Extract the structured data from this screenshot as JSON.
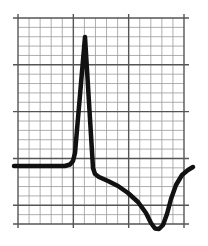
{
  "figure": {
    "colors": {
      "background": "#ffffff",
      "minor_grid": "#9a9a9a",
      "major_grid": "#555555",
      "trace": "#111111"
    },
    "grid": {
      "left": 18,
      "top": 18,
      "right": 184,
      "bottom": 224,
      "columns": 15,
      "rows": 22,
      "major_every_col": 5,
      "major_every_row": 5
    },
    "trace": {
      "label": "waveform",
      "stroke_width": 4.5,
      "points": [
        [
          14,
          166
        ],
        [
          65,
          166
        ],
        [
          70,
          164.5
        ],
        [
          73,
          161
        ],
        [
          75,
          153
        ],
        [
          85,
          37
        ],
        [
          93,
          168
        ],
        [
          95,
          174
        ],
        [
          99,
          177
        ],
        [
          108,
          181
        ],
        [
          118,
          186
        ],
        [
          128,
          193
        ],
        [
          138,
          202
        ],
        [
          146,
          213
        ],
        [
          151,
          223
        ],
        [
          155,
          228.5
        ],
        [
          159,
          229
        ],
        [
          163,
          225
        ],
        [
          167,
          214
        ],
        [
          171,
          199
        ],
        [
          176,
          185
        ],
        [
          182,
          175
        ],
        [
          188,
          170
        ],
        [
          193,
          167
        ]
      ]
    }
  }
}
